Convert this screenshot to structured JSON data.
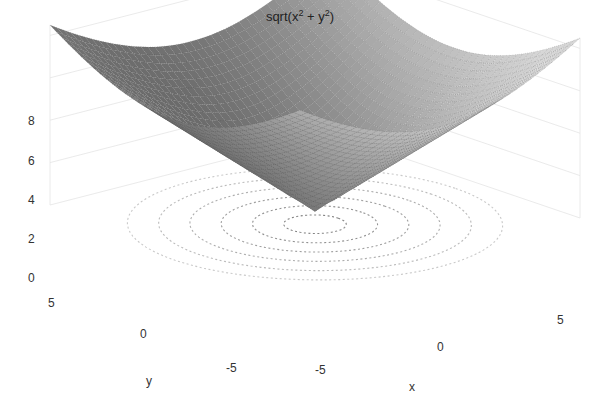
{
  "chart_data": {
    "type": "surface3d",
    "title_parts": {
      "base": "sqrt(x",
      "sup1": "2",
      "mid": " + y",
      "sup2": "2",
      "end": ")"
    },
    "function": "z = sqrt(x^2 + y^2)",
    "x": {
      "label": "x",
      "range": [
        -6,
        6
      ],
      "ticks": [
        -5,
        0,
        5
      ]
    },
    "y": {
      "label": "y",
      "range": [
        -6,
        6
      ],
      "ticks": [
        -5,
        0,
        5
      ]
    },
    "z": {
      "label": "",
      "range": [
        0,
        8.5
      ],
      "ticks": [
        0,
        2,
        4,
        6,
        8
      ]
    },
    "contour_levels": [
      1,
      2,
      3,
      4,
      5,
      6
    ],
    "grid": true,
    "surface_color": "#8a8a8a",
    "mesh_dot_color": "#3a3a3a",
    "contour_color": "#777777",
    "legend": null
  },
  "labels": {
    "z_ticks": [
      "8",
      "6",
      "4",
      "2",
      "0"
    ],
    "y_ticks": [
      "5",
      "0",
      "-5"
    ],
    "x_ticks": [
      "-5",
      "0",
      "5"
    ],
    "x_axis": "x",
    "y_axis": "y"
  }
}
